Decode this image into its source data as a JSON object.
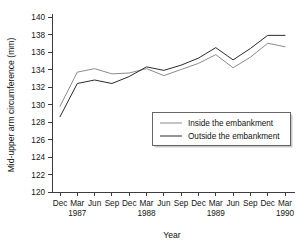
{
  "chart_data": {
    "type": "line",
    "title": "",
    "xlabel": "Year",
    "ylabel": "Mid-upper arm circumference (mm)",
    "ylim": [
      120,
      140
    ],
    "ytick_labels": [
      "120",
      "122",
      "124",
      "126",
      "128",
      "130",
      "132",
      "134",
      "136",
      "138",
      "140"
    ],
    "ytick_values": [
      120,
      122,
      124,
      126,
      128,
      130,
      132,
      134,
      136,
      138,
      140
    ],
    "grid": false,
    "legend_position": "lower right",
    "categories": [
      "Dec",
      "Mar",
      "Jun",
      "Sep",
      "Dec",
      "Mar",
      "Jun",
      "Sep",
      "Dec",
      "Mar",
      "Jun",
      "Sep",
      "Dec",
      "Mar"
    ],
    "year_labels": [
      {
        "label": "1987",
        "index": 1
      },
      {
        "label": "1988",
        "index": 5
      },
      {
        "label": "1989",
        "index": 9
      },
      {
        "label": "1990",
        "index": 13
      }
    ],
    "series": [
      {
        "name": "Inside the embankment",
        "color": "#8c8c8c",
        "values": [
          129.8,
          133.7,
          134.1,
          133.5,
          133.6,
          134.1,
          133.3,
          134.0,
          134.7,
          135.7,
          134.2,
          135.4,
          137.0,
          136.6
        ]
      },
      {
        "name": "Outside the embankment",
        "color": "#2b2b2b",
        "values": [
          128.6,
          132.4,
          132.8,
          132.4,
          133.2,
          134.3,
          133.9,
          134.5,
          135.3,
          136.5,
          135.1,
          136.4,
          137.9,
          137.9
        ]
      }
    ]
  },
  "legend": {
    "entries": [
      {
        "label": "Inside the embankment"
      },
      {
        "label": "Outside the embankment"
      }
    ]
  },
  "axes": {
    "x_title": "Year",
    "y_title": "Mid-upper arm circumference (mm)"
  }
}
